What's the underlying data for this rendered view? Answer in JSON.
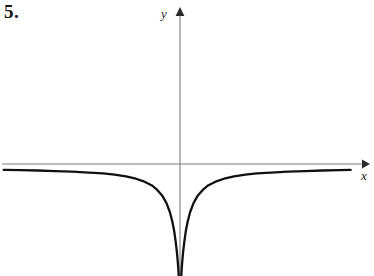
{
  "figure": {
    "exercise_number": "5.",
    "background_color": "#ffffff",
    "curve_color": "#111111",
    "axis_color": "#7c7c7c",
    "label_color": "#1a1a1a"
  },
  "axes": {
    "y_label": "y",
    "x_label": "x",
    "x_axis": {
      "y_pixel": 164,
      "x_start_pixel": 2,
      "x_end_pixel": 366,
      "arrow": "right-arrow-icon"
    },
    "y_axis": {
      "x_pixel": 180,
      "y_start_pixel": 276,
      "y_end_pixel": 12,
      "arrow": "up-arrow-icon"
    },
    "origin_pixel": [
      180,
      164
    ]
  },
  "chart_data": {
    "type": "line",
    "title": "",
    "xlabel": "x",
    "ylabel": "y",
    "grid": false,
    "legend": null,
    "axis_ranges": {
      "x": [
        -6.2,
        6.4
      ],
      "y": [
        -3.8,
        2.6
      ]
    },
    "asymptotes": {
      "vertical": [
        0
      ],
      "horizontal": [
        -0.22
      ]
    },
    "series": [
      {
        "name": "left branch",
        "x": [
          -6.2,
          -5.6,
          -5.0,
          -4.4,
          -3.8,
          -3.2,
          -2.7,
          -2.3,
          -1.9,
          -1.55,
          -1.25,
          -1.0,
          -0.8,
          -0.62,
          -0.48,
          -0.36,
          -0.27,
          -0.2,
          -0.15,
          -0.11,
          -0.08,
          -0.06,
          -0.045
        ],
        "y": [
          -0.2,
          -0.21,
          -0.22,
          -0.24,
          -0.26,
          -0.29,
          -0.32,
          -0.36,
          -0.42,
          -0.5,
          -0.6,
          -0.72,
          -0.88,
          -1.08,
          -1.32,
          -1.62,
          -1.95,
          -2.3,
          -2.65,
          -2.98,
          -3.3,
          -3.55,
          -3.8
        ]
      },
      {
        "name": "right branch",
        "x": [
          0.045,
          0.06,
          0.08,
          0.11,
          0.15,
          0.2,
          0.27,
          0.36,
          0.48,
          0.62,
          0.8,
          1.0,
          1.25,
          1.55,
          1.9,
          2.3,
          2.7,
          3.2,
          3.8,
          4.4,
          5.0,
          5.6,
          6.0
        ],
        "y": [
          -3.8,
          -3.55,
          -3.3,
          -2.98,
          -2.65,
          -2.3,
          -1.95,
          -1.62,
          -1.32,
          -1.08,
          -0.88,
          -0.72,
          -0.6,
          -0.5,
          -0.42,
          -0.36,
          -0.32,
          -0.29,
          -0.26,
          -0.24,
          -0.22,
          -0.21,
          -0.2
        ]
      }
    ],
    "tick_labels": {
      "x": [],
      "y": []
    }
  }
}
